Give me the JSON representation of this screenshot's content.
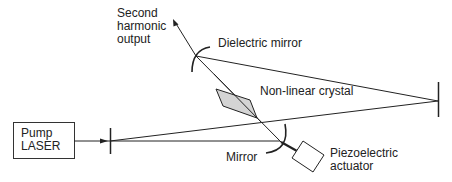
{
  "diagram": {
    "colors": {
      "line": "#222222",
      "crystal_fill": "#d4d4d4",
      "background": "#ffffff"
    },
    "components": {
      "pump_laser": {
        "label_line1": "Pump",
        "label_line2": "LASER"
      },
      "dielectric_mirror": {
        "label": "Dielectric mirror"
      },
      "nonlinear_crystal": {
        "label": "Non-linear crystal"
      },
      "mirror": {
        "label": "Mirror"
      },
      "piezo": {
        "label_line1": "Piezoelectric",
        "label_line2": "actuator"
      },
      "output": {
        "label_line1": "Second",
        "label_line2": "harmonic",
        "label_line3": "output"
      }
    }
  }
}
